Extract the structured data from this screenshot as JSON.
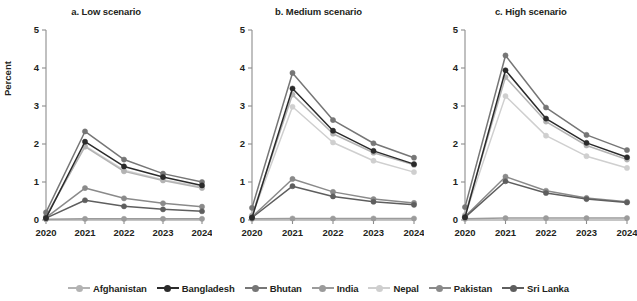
{
  "figure": {
    "ylabel": "Percent",
    "width": 637,
    "height": 301
  },
  "legend": {
    "position": "bottom-center",
    "entries": [
      {
        "name": "Afghanistan",
        "color": "#b3b3b3"
      },
      {
        "name": "Bangladesh",
        "color": "#2b2b2b"
      },
      {
        "name": "Bhutan",
        "color": "#767676"
      },
      {
        "name": "India",
        "color": "#9b9b9b"
      },
      {
        "name": "Nepal",
        "color": "#cfcfcf"
      },
      {
        "name": "Pakistan",
        "color": "#8a8a8a"
      },
      {
        "name": "Sri Lanka",
        "color": "#5e5e5e"
      }
    ]
  },
  "chart_data": {
    "type": "line",
    "title": "",
    "xlabel": "",
    "ylabel": "Percent",
    "x": [
      "2020",
      "2021",
      "2022",
      "2023",
      "2024"
    ],
    "ylim": [
      0,
      5
    ],
    "yticks": [
      0,
      1,
      2,
      3,
      4,
      5
    ],
    "grid": false,
    "panels": [
      {
        "key": "low",
        "title": "a. Low scenario",
        "series": [
          {
            "name": "Afghanistan",
            "color": "#b3b3b3",
            "values": [
              0.1,
              1.93,
              1.28,
              1.04,
              0.84
            ]
          },
          {
            "name": "Bangladesh",
            "color": "#2b2b2b",
            "values": [
              0.05,
              2.06,
              1.41,
              1.13,
              0.91
            ]
          },
          {
            "name": "Bhutan",
            "color": "#767676",
            "values": [
              0.2,
              2.33,
              1.59,
              1.22,
              1.0
            ]
          },
          {
            "name": "India",
            "color": "#9b9b9b",
            "values": [
              0.02,
              0.03,
              0.03,
              0.03,
              0.03
            ]
          },
          {
            "name": "Nepal",
            "color": "#cfcfcf",
            "values": [
              0.08,
              1.95,
              1.31,
              1.06,
              0.87
            ]
          },
          {
            "name": "Pakistan",
            "color": "#8a8a8a",
            "values": [
              0.06,
              0.84,
              0.57,
              0.44,
              0.35
            ]
          },
          {
            "name": "Sri Lanka",
            "color": "#5e5e5e",
            "values": [
              0.05,
              0.52,
              0.36,
              0.28,
              0.23
            ]
          }
        ]
      },
      {
        "key": "medium",
        "title": "b. Medium scenario",
        "series": [
          {
            "name": "Afghanistan",
            "color": "#b3b3b3",
            "values": [
              0.12,
              3.3,
              2.27,
              1.77,
              1.45
            ]
          },
          {
            "name": "Bangladesh",
            "color": "#2b2b2b",
            "values": [
              0.06,
              3.46,
              2.35,
              1.82,
              1.47
            ]
          },
          {
            "name": "Bhutan",
            "color": "#767676",
            "values": [
              0.32,
              3.87,
              2.63,
              2.02,
              1.64
            ]
          },
          {
            "name": "India",
            "color": "#9b9b9b",
            "values": [
              0.03,
              0.04,
              0.04,
              0.04,
              0.04
            ]
          },
          {
            "name": "Nepal",
            "color": "#cfcfcf",
            "values": [
              0.1,
              2.98,
              2.04,
              1.56,
              1.26
            ]
          },
          {
            "name": "Pakistan",
            "color": "#8a8a8a",
            "values": [
              0.08,
              1.08,
              0.74,
              0.55,
              0.45
            ]
          },
          {
            "name": "Sri Lanka",
            "color": "#5e5e5e",
            "values": [
              0.06,
              0.89,
              0.62,
              0.48,
              0.4
            ]
          }
        ]
      },
      {
        "key": "high",
        "title": "c. High scenario",
        "series": [
          {
            "name": "Afghanistan",
            "color": "#b3b3b3",
            "values": [
              0.13,
              3.76,
              2.59,
              1.96,
              1.59
            ]
          },
          {
            "name": "Bangladesh",
            "color": "#2b2b2b",
            "values": [
              0.07,
              3.94,
              2.67,
              2.03,
              1.65
            ]
          },
          {
            "name": "Bhutan",
            "color": "#767676",
            "values": [
              0.34,
              4.33,
              2.96,
              2.24,
              1.84
            ]
          },
          {
            "name": "India",
            "color": "#9b9b9b",
            "values": [
              0.03,
              0.05,
              0.05,
              0.05,
              0.05
            ]
          },
          {
            "name": "Nepal",
            "color": "#cfcfcf",
            "values": [
              0.11,
              3.26,
              2.22,
              1.68,
              1.37
            ]
          },
          {
            "name": "Pakistan",
            "color": "#8a8a8a",
            "values": [
              0.09,
              1.14,
              0.77,
              0.58,
              0.48
            ]
          },
          {
            "name": "Sri Lanka",
            "color": "#5e5e5e",
            "values": [
              0.07,
              1.02,
              0.71,
              0.55,
              0.46
            ]
          }
        ]
      }
    ]
  }
}
